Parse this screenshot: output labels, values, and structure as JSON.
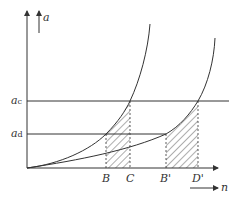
{
  "diagram": {
    "y_axis_label": "a",
    "x_axis_label": "n",
    "levels": [
      {
        "name": "a_c",
        "base": "a",
        "sub": "c"
      },
      {
        "name": "a_d",
        "base": "a",
        "sub": "d"
      }
    ],
    "x_markers": [
      "B",
      "C",
      "B'",
      "D'"
    ],
    "colors": {
      "line": "#333333"
    }
  }
}
